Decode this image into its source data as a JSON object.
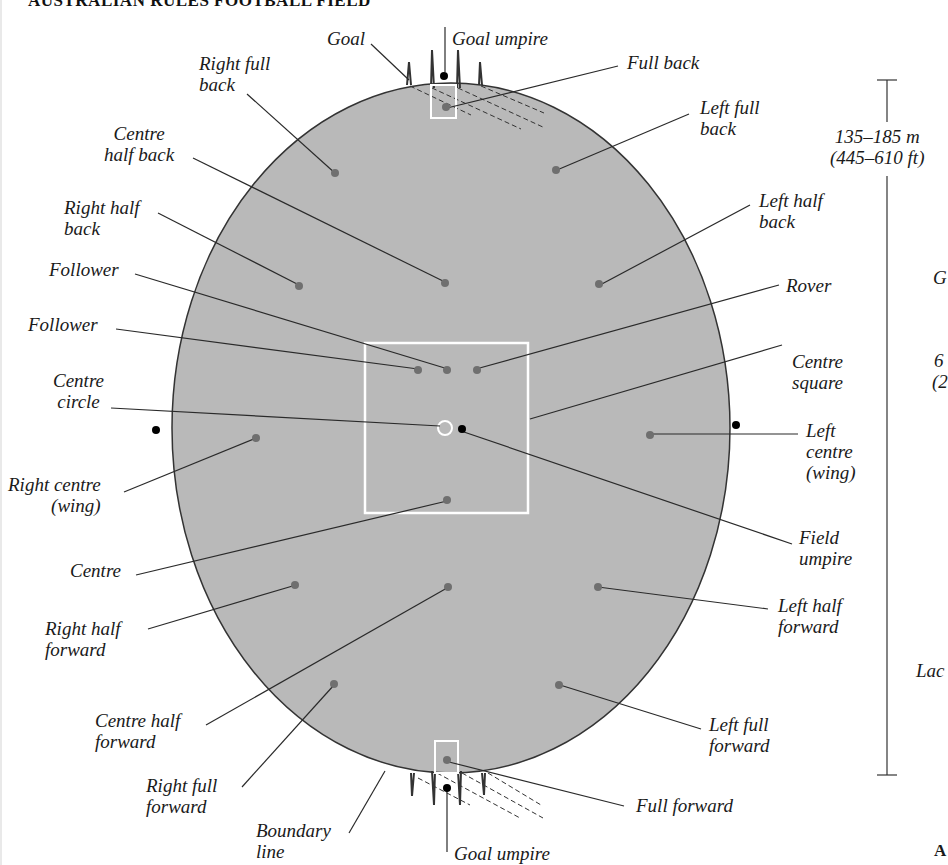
{
  "title": "AUSTRALIAN RULES FOOTBALL FIELD",
  "colors": {
    "field": "#b9b9b9",
    "boundary": "#333333",
    "player_dot": "#6f6f6f",
    "umpire_dot": "#000000",
    "markings": "#ffffff",
    "leader_line": "#2a2a2a"
  },
  "labels": {
    "goal": "Goal",
    "goal_umpire_top": "Goal umpire",
    "full_back": "Full back",
    "right_full_back": "Right full\nback",
    "left_full_back": "Left full\nback",
    "centre_half_back": "Centre\nhalf back",
    "right_half_back": "Right half\nback",
    "left_half_back": "Left half\nback",
    "follower_1": "Follower",
    "follower_2": "Follower",
    "rover": "Rover",
    "centre_square": "Centre\nsquare",
    "centre_circle": "Centre\ncircle",
    "right_centre_wing": "Right centre\n(wing)",
    "left_centre_wing": "Left\ncentre\n(wing)",
    "centre": "Centre",
    "field_umpire": "Field\numpire",
    "right_half_forward": "Right half\nforward",
    "left_half_forward": "Left half\nforward",
    "centre_half_forward": "Centre half\nforward",
    "right_full_forward": "Right full\nforward",
    "left_full_forward": "Left full\nforward",
    "full_forward": "Full forward",
    "boundary_line": "Boundary\nline",
    "goal_umpire_bottom": "Goal umpire"
  },
  "dimension": {
    "length_label": "135–185 m\n(445–610 ft)"
  },
  "clipped_text": {
    "right_g": "G",
    "right_6": "6",
    "right_paren": "(2",
    "right_lac": "Lac",
    "right_a": "A"
  }
}
